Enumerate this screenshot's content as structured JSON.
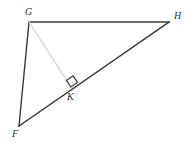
{
  "figure": {
    "type": "geometry-diagram",
    "canvas": {
      "width": 196,
      "height": 150
    },
    "background_color": "#ffffff",
    "stroke_color": "#3a3a3a",
    "altitude_color": "#d9d9d9",
    "right_angle_color": "#3a3a3a",
    "label_color": "#2e2e2e",
    "points": {
      "G": {
        "label": "G",
        "x": 29,
        "y": 22
      },
      "H": {
        "label": "H",
        "x": 169,
        "y": 22
      },
      "F": {
        "label": "F",
        "x": 19,
        "y": 126
      },
      "K": {
        "label": "K",
        "x": 71,
        "y": 87
      }
    },
    "segments": [
      {
        "name": "GH",
        "from": "G",
        "to": "H",
        "color": "#3a3a3a",
        "width": 1.4,
        "style": "solid"
      },
      {
        "name": "GF",
        "from": "G",
        "to": "F",
        "color": "#3a3a3a",
        "width": 1.4,
        "style": "solid"
      },
      {
        "name": "FH",
        "from": "F",
        "to": "H",
        "color": "#3a3a3a",
        "width": 1.4,
        "style": "solid"
      },
      {
        "name": "GK",
        "from": "G",
        "to": "K",
        "color": "#d9d9d9",
        "width": 1.4,
        "style": "solid"
      }
    ],
    "right_angle": {
      "at": "K",
      "marker": "square",
      "size": 8,
      "measure": "90"
    },
    "labels": {
      "G": "G",
      "H": "H",
      "F": "F",
      "K": "K"
    }
  }
}
